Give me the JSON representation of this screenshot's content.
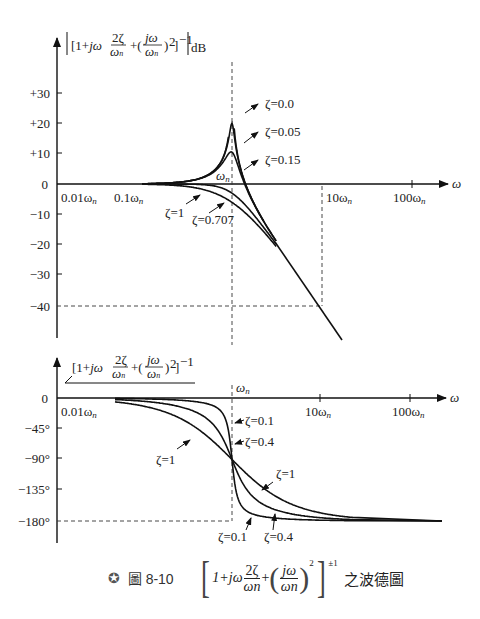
{
  "chart_data": [
    {
      "type": "line",
      "title": "|[1 + jω 2ζ/ωn + (jω/ωn)²]⁻¹| dB",
      "xlabel": "ω",
      "ylabel": "|[1+jω 2ζ/ωn + (jω/ωn)²]^-1| dB",
      "x_scale": "log",
      "x_ticks": [
        "0.01ωn",
        "0.1ωn",
        "ωn",
        "10ωn",
        "100ωn"
      ],
      "x_tick_values": [
        0.01,
        0.1,
        1,
        10,
        100
      ],
      "y_ticks": [
        "+30",
        "+20",
        "+10",
        "0",
        "-10",
        "-20",
        "-30",
        "-40"
      ],
      "y_tick_values": [
        30,
        20,
        10,
        0,
        -10,
        -20,
        -30,
        -40
      ],
      "ylim": [
        -48,
        40
      ],
      "grid": false,
      "reference_lines": [
        {
          "type": "vertical-dashed",
          "x": 1,
          "label": "ωn"
        },
        {
          "type": "vertical-dashed",
          "x": 10
        },
        {
          "type": "horizontal-dashed",
          "y": -40
        }
      ],
      "series": [
        {
          "name": "ζ=0.0",
          "zeta": 0.0,
          "peak_db": "infinite (resonance at ωn)"
        },
        {
          "name": "ζ=0.05",
          "zeta": 0.05,
          "peak_db": 20
        },
        {
          "name": "ζ=0.15",
          "zeta": 0.15,
          "peak_db": 10.5
        },
        {
          "name": "ζ=0.707",
          "zeta": 0.707,
          "peak_db": 0
        },
        {
          "name": "ζ=1",
          "zeta": 1.0,
          "value_at_wn_db": -6
        }
      ],
      "asymptote": {
        "description": "-40 dB/decade above ωn",
        "points": [
          [
            1,
            0
          ],
          [
            10,
            -40
          ]
        ]
      },
      "annotations": [
        "ζ=0.0",
        "ζ=0.05",
        "ζ=0.15",
        "ζ=0.707",
        "ζ=1",
        "ωn"
      ]
    },
    {
      "type": "line",
      "title": "∠[1 + jω 2ζ/ωn + (jω/ωn)²]⁻¹",
      "xlabel": "ω",
      "ylabel": "∠[1+jω 2ζ/ωn + (jω/ωn)²]^-1",
      "x_scale": "log",
      "x_ticks": [
        "0.01ωn",
        "ωn",
        "10ωn",
        "100ωn"
      ],
      "x_tick_values": [
        0.01,
        1,
        10,
        100
      ],
      "y_ticks": [
        "0",
        "-45°",
        "-90°",
        "-135°",
        "-180°"
      ],
      "y_tick_values": [
        0,
        -45,
        -90,
        -135,
        -180
      ],
      "ylim": [
        -195,
        0
      ],
      "grid": false,
      "reference_lines": [
        {
          "type": "vertical-dashed",
          "x": 1,
          "label": "ωn"
        },
        {
          "type": "horizontal-dashed",
          "y": -180
        }
      ],
      "series": [
        {
          "name": "ζ=0.1",
          "zeta": 0.1,
          "value_at_wn_deg": -90
        },
        {
          "name": "ζ=0.4",
          "zeta": 0.4,
          "value_at_wn_deg": -90
        },
        {
          "name": "ζ=1",
          "zeta": 1.0,
          "value_at_wn_deg": -90
        }
      ],
      "annotations": [
        "ζ=0.1",
        "ζ=0.4",
        "ζ=1",
        "ζ=0.1",
        "ζ=0.4",
        "ζ=1",
        "ωn"
      ]
    }
  ],
  "upper": {
    "ylabel": "|[1+jω 2ζ/ωn + (jω/ωn)²]⁻¹| dB",
    "y_ticks": [
      "+30",
      "+20",
      "+10",
      "0",
      "−10",
      "−20",
      "−30",
      "−40"
    ],
    "x_ticks": [
      "0.01ω",
      "0.1ω",
      "10ω",
      "100ω"
    ],
    "x_sub": "n",
    "omega_n": "ω",
    "x_axis_label": "ω",
    "labels": {
      "z0": "ζ=0.0",
      "z005": "ζ=0.05",
      "z015": "ζ=0.15",
      "z0707": "ζ=0.707",
      "z1": "ζ=1"
    }
  },
  "lower": {
    "ylabel": "∠[1+jω 2ζ/ωn + (jω/ωn)²]⁻¹",
    "y_ticks": [
      "0",
      "−45°",
      "−90°",
      "−135°",
      "−180°"
    ],
    "x_ticks": [
      "0.01ω",
      "10ω",
      "100ω"
    ],
    "x_sub": "n",
    "omega_n": "ω",
    "x_axis_label": "ω",
    "labels": {
      "z01_top": "ζ=0.1",
      "z04_top": "ζ=0.4",
      "z1_left": "ζ=1",
      "z1_right": "ζ=1",
      "z01_bottom": "ζ=0.1",
      "z04_bottom": "ζ=0.4"
    }
  },
  "caption": {
    "icon": "✪",
    "figure_glyph": "圖",
    "figure_number": "8-10",
    "formula_one": "1+jω",
    "formula_num": "2ζ",
    "formula_den": "ωn",
    "formula_plus": "+",
    "formula_num2": "jω",
    "formula_den2": "ωn",
    "formula_sq": "2",
    "formula_exp": "±1",
    "suffix": "之波德圖"
  }
}
